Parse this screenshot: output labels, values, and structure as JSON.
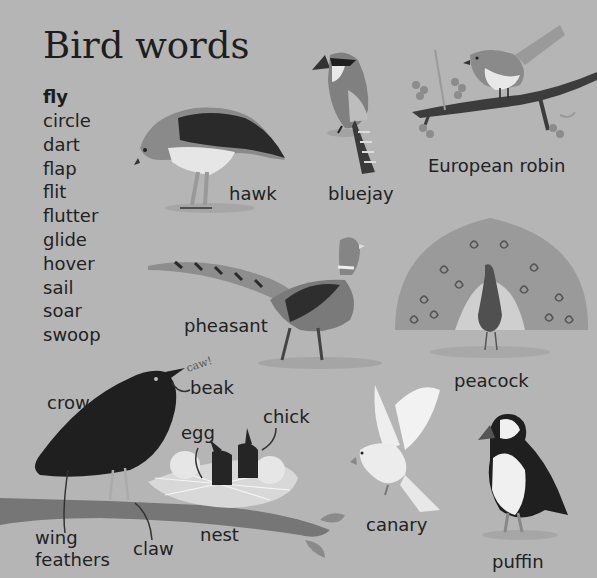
{
  "title": "Bird words",
  "verbs": {
    "heading": "fly",
    "words": [
      "circle",
      "dart",
      "flap",
      "flit",
      "flutter",
      "glide",
      "hover",
      "sail",
      "soar",
      "swoop"
    ]
  },
  "birds": {
    "hawk": "hawk",
    "bluejay": "bluejay",
    "robin": "European robin",
    "pheasant": "pheasant",
    "peacock": "peacock",
    "crow": "crow",
    "canary": "canary",
    "puffin": "puffin"
  },
  "parts": {
    "beak": "beak",
    "egg": "egg",
    "chick": "chick",
    "nest": "nest",
    "claw": "claw",
    "wing_feathers_1": "wing",
    "wing_feathers_2": "feathers"
  },
  "sound": "caw!",
  "colors": {
    "background": "#b5b5b5",
    "text": "#222222"
  }
}
